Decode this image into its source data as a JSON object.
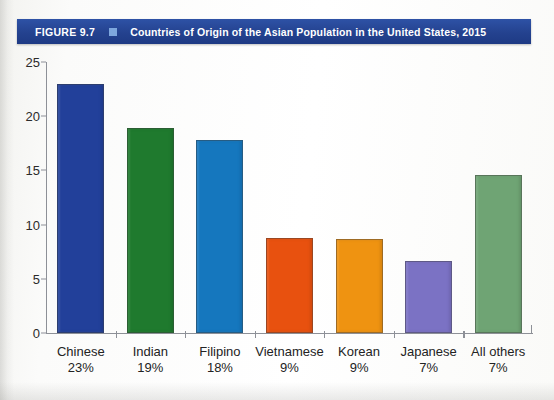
{
  "figure": {
    "number_label": "FIGURE 9.7",
    "marker_icon": "square-marker",
    "title": "Countries of Origin of the Asian Population in the United States, 2015",
    "banner_color": "#24428f",
    "marker_color": "#7ea7dd",
    "banner_text_color": "#ffffff"
  },
  "chart_data": {
    "type": "bar",
    "title": "Countries of Origin of the Asian Population in the United States, 2015",
    "xlabel": "",
    "ylabel": "",
    "ylim": [
      0,
      25
    ],
    "yticks": [
      0,
      5,
      10,
      15,
      20,
      25
    ],
    "ytick_labels": [
      "0",
      "5",
      "10",
      "15",
      "20",
      "25"
    ],
    "grid": false,
    "legend": "none",
    "categories": [
      "Chinese",
      "Indian",
      "Filipino",
      "Vietnamese",
      "Korean",
      "Japanese",
      "All others"
    ],
    "category_percents": [
      "23%",
      "19%",
      "18%",
      "9%",
      "9%",
      "7%",
      "7%"
    ],
    "values": [
      23.0,
      18.9,
      17.8,
      8.8,
      8.7,
      6.6,
      14.6
    ],
    "bar_colors": [
      "#22409a",
      "#1f7a2e",
      "#1577be",
      "#e8510f",
      "#ef9311",
      "#7b72c4",
      "#6fa474"
    ],
    "series": [
      {
        "name": "Population (millions / share index)",
        "values": [
          23.0,
          18.9,
          17.8,
          8.8,
          8.7,
          6.6,
          14.6
        ]
      }
    ]
  },
  "axis": {
    "line_color": "#8d9097"
  }
}
